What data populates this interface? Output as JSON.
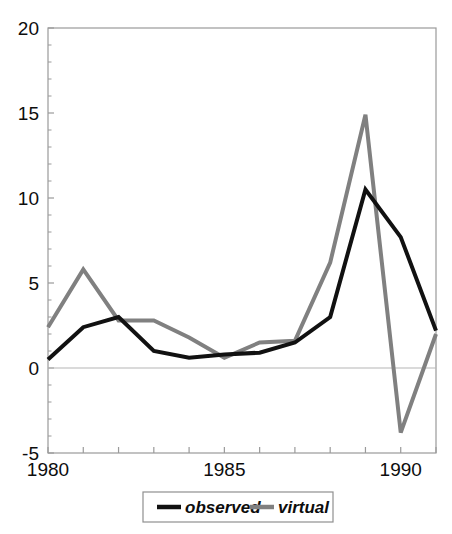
{
  "chart_data": {
    "type": "line",
    "title": "",
    "xlabel": "",
    "ylabel": "",
    "x": [
      1980,
      1981,
      1982,
      1983,
      1984,
      1985,
      1986,
      1987,
      1988,
      1989,
      1990,
      1991
    ],
    "xlim": [
      1980,
      1991
    ],
    "ylim": [
      -5,
      20
    ],
    "yticks": [
      20,
      15,
      10,
      5,
      0,
      -5
    ],
    "ytick_labels": [
      "20",
      "15",
      "10",
      "5",
      "0",
      "-5"
    ],
    "xticks": [
      1980,
      1981,
      1982,
      1983,
      1984,
      1985,
      1986,
      1987,
      1988,
      1989,
      1990,
      1991
    ],
    "xtick_labels_shown": [
      "1980",
      "1985",
      "1990"
    ],
    "xtick_labels_shown_at": [
      1980,
      1985,
      1990
    ],
    "grid": false,
    "zero_line": 0,
    "legend_position": "bottom",
    "series": [
      {
        "name": "observed",
        "color": "#111111",
        "width": 4,
        "values": [
          0.5,
          2.4,
          3.0,
          1.0,
          0.6,
          0.8,
          0.9,
          1.5,
          3.0,
          10.5,
          7.7,
          2.2
        ]
      },
      {
        "name": "virtual",
        "color": "#808080",
        "width": 4,
        "values": [
          2.4,
          5.8,
          2.8,
          2.8,
          1.8,
          0.6,
          1.5,
          1.6,
          6.2,
          14.9,
          -3.8,
          2.0
        ]
      }
    ]
  },
  "axes": {
    "y_labels": [
      "20",
      "15",
      "10",
      "5",
      "0",
      "-5"
    ],
    "x_labels": [
      "1980",
      "1985",
      "1990"
    ]
  },
  "legend": {
    "items": [
      {
        "label": "observed",
        "color": "#111111"
      },
      {
        "label": "virtual",
        "color": "#808080"
      }
    ]
  },
  "colors": {
    "observed": "#111111",
    "virtual": "#808080",
    "axis": "#9a9a9a",
    "zero_line": "#b5b5b5",
    "text": "#0d0d0d",
    "background": "#ffffff"
  }
}
